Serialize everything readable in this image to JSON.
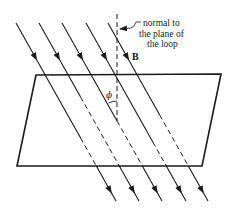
{
  "figure": {
    "labels": {
      "normal_line1": "normal to",
      "normal_line2": "the plane of",
      "normal_line3": "the loop",
      "field": "B",
      "angle": "ϕ"
    },
    "field_line_count": 5,
    "colors": {
      "line": "#1a1a1a",
      "background": "#ffffff"
    }
  }
}
